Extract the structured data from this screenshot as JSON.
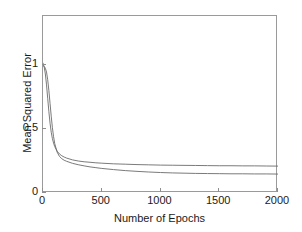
{
  "chart_data": {
    "type": "line",
    "title": "",
    "xlabel": "Number of Epochs",
    "ylabel": "Mean Squared Error",
    "xlim": [
      0,
      2000
    ],
    "ylim": [
      0,
      1.383
    ],
    "xticks": [
      0,
      500,
      1000,
      1500,
      2000
    ],
    "xtick_labels": [
      "0",
      "500",
      "1000",
      "1500",
      "2000"
    ],
    "yticks": [
      0,
      0.5,
      1
    ],
    "ytick_labels": [
      "0",
      "0.5",
      "1"
    ],
    "grid": false,
    "legend": null,
    "background": "#ffffff",
    "axis_color": "#9a9a9a",
    "line_color": "#6b6b6b",
    "x": [
      0,
      10,
      20,
      30,
      40,
      50,
      60,
      70,
      80,
      90,
      100,
      120,
      140,
      160,
      180,
      200,
      250,
      300,
      350,
      400,
      450,
      500,
      600,
      700,
      800,
      900,
      1000,
      1100,
      1200,
      1300,
      1400,
      1500,
      1600,
      1700,
      1800,
      1900,
      2000
    ],
    "series": [
      {
        "name": "curve-upper",
        "color": "#6b6b6b",
        "final_value": 0.21,
        "values": [
          1.015,
          0.985,
          0.93,
          0.845,
          0.74,
          0.635,
          0.545,
          0.475,
          0.425,
          0.39,
          0.362,
          0.327,
          0.305,
          0.291,
          0.281,
          0.273,
          0.259,
          0.25,
          0.244,
          0.24,
          0.236,
          0.233,
          0.228,
          0.225,
          0.222,
          0.22,
          0.218,
          0.217,
          0.216,
          0.215,
          0.214,
          0.213,
          0.213,
          0.212,
          0.212,
          0.211,
          0.21
        ]
      },
      {
        "name": "curve-lower",
        "color": "#6b6b6b",
        "final_value": 0.148,
        "values": [
          0.995,
          0.99,
          0.975,
          0.945,
          0.885,
          0.8,
          0.7,
          0.6,
          0.51,
          0.44,
          0.385,
          0.32,
          0.286,
          0.268,
          0.256,
          0.248,
          0.232,
          0.221,
          0.212,
          0.204,
          0.198,
          0.192,
          0.183,
          0.175,
          0.169,
          0.164,
          0.16,
          0.157,
          0.155,
          0.153,
          0.152,
          0.151,
          0.15,
          0.15,
          0.149,
          0.149,
          0.148
        ]
      }
    ]
  }
}
